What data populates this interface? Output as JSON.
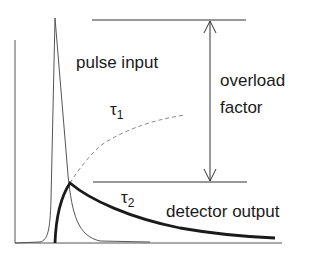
{
  "diagram": {
    "labels": {
      "pulse_input": "pulse input",
      "overload_line1": "overload",
      "overload_line2": "factor",
      "tau1_base": "τ",
      "tau1_sub": "1",
      "tau2_base": "τ",
      "tau2_sub": "2",
      "detector_output": "detector output"
    },
    "colors": {
      "ink": "#1a1a1a",
      "thin_line": "#555555",
      "dashed_line": "#888888"
    }
  }
}
